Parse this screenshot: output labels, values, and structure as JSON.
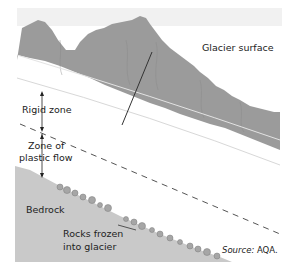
{
  "diagram": {
    "labels": {
      "glacier_surface": "Glacier surface",
      "rigid_zone": "Rigid zone",
      "zone_plastic_line1": "Zone of",
      "zone_plastic_line2": "plastic flow",
      "bedrock": "Bedrock",
      "rocks_line1": "Rocks frozen",
      "rocks_line2": "into glacier",
      "source_prefix": "Source:",
      "source_name": "AQA."
    },
    "colors": {
      "mountain": "#9b9b9b",
      "bedrock": "#c9c9c9",
      "sky_strip": "#f1f1f1",
      "line": "#333333"
    }
  }
}
